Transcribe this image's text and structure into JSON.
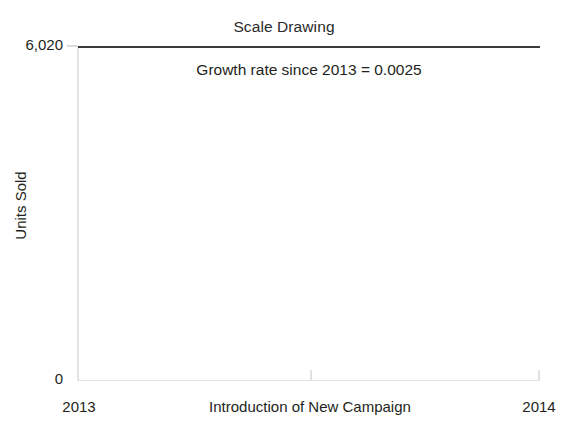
{
  "chart_data": {
    "type": "line",
    "title": "Scale Drawing",
    "xlabel": "Introduction of New Campaign",
    "ylabel": "Units Sold",
    "x": [
      "2013",
      "2014"
    ],
    "series": [
      {
        "name": "Units Sold",
        "values": [
          6020,
          6020
        ],
        "color": "#3a3a3a"
      }
    ],
    "xlim": [
      "2013",
      "2014"
    ],
    "ylim": [
      0,
      6020
    ],
    "xticklabels": [
      "2013",
      "2014"
    ],
    "yticklabels": [
      "6,020",
      "0"
    ],
    "grid": false,
    "legend": false,
    "legend_position": "none",
    "annotations": [
      {
        "text": "Growth rate since 2013 = 0.0025",
        "x": "midpoint",
        "y": 5900
      }
    ],
    "note": "Scale drawing: vertical axis spans 0 to 6,020 so the small growth appears as a flat line."
  },
  "axes": {
    "y_label_top": "6,020",
    "y_label_bottom": "0",
    "y_title": "Units Sold",
    "x_label_left": "2013",
    "x_label_right": "2014",
    "x_title": "Introduction of New Campaign"
  },
  "annotation": {
    "growth_rate_text": "Growth rate since 2013 = 0.0025"
  },
  "style": {
    "axis_color": "#e3e3e3",
    "tick_color": "#dcdcdc",
    "series_color": "#3a3a3a",
    "text_color": "#231f20",
    "background": "#ffffff"
  }
}
